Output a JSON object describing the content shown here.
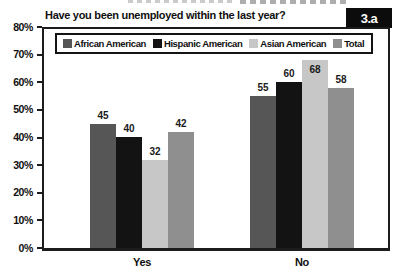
{
  "figure": {
    "title": "Have you been unemployed within the last year?",
    "label": "3.a"
  },
  "chart_data": {
    "type": "bar",
    "title": "Have you been unemployed within the last year?",
    "categories": [
      "Yes",
      "No"
    ],
    "series": [
      {
        "name": "African American",
        "values": [
          45,
          55
        ],
        "color": "#565656"
      },
      {
        "name": "Hispanic American",
        "values": [
          40,
          60
        ],
        "color": "#131313"
      },
      {
        "name": "Asian American",
        "values": [
          32,
          68
        ],
        "color": "#c7c7c7"
      },
      {
        "name": "Total",
        "values": [
          42,
          58
        ],
        "color": "#8f8f8f"
      }
    ],
    "ylim": [
      0,
      80
    ],
    "ytick_labels": [
      "0%",
      "10%",
      "20%",
      "30%",
      "40%",
      "50%",
      "60%",
      "70%",
      "80%"
    ],
    "grid": false,
    "legend_position": "top-inside",
    "value_labels": true,
    "axis_color": "#1c1c1c"
  }
}
